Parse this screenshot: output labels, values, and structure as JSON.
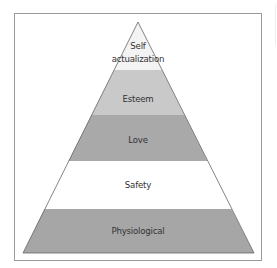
{
  "diagram": {
    "type": "pyramid",
    "levels": [
      {
        "label": "Physiological",
        "color": "#a6a6a6"
      },
      {
        "label": "Safety",
        "color": "#ffffff"
      },
      {
        "label": "Love",
        "color": "#a9a9a9"
      },
      {
        "label": "Esteem",
        "color": "#c9c9c9"
      },
      {
        "label_line1": "Self",
        "label_line2": "actualization",
        "color": "#f3f3f3"
      }
    ],
    "outline_color": "#666666",
    "frame_color": "#9a9a9a"
  }
}
